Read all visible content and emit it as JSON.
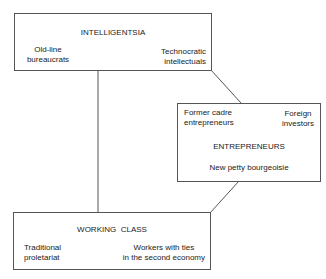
{
  "diagram": {
    "intelligentsia": {
      "title": "INTELLIGENTSIA",
      "left_line1": "Old-line",
      "left_line2": "bureaucrats",
      "right_line1": "Technocratic",
      "right_line2": "intellectuals"
    },
    "entrepreneurs": {
      "title": "ENTREPRENEURS",
      "left_line1": "Former cadre",
      "left_line2": "entrepreneurs",
      "right_line1": "Foreign",
      "right_line2": "investors",
      "bottom": "New petty bourgeoisie"
    },
    "working_class": {
      "title": "WORKING  CLASS",
      "left_line1": "Traditional",
      "left_line2": "proletariat",
      "right_line1": "Workers with ties",
      "right_line2": "in the second economy"
    },
    "colors": {
      "line": "#555555",
      "text": "#222222"
    }
  }
}
